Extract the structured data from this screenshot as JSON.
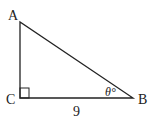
{
  "diagram": {
    "type": "right-triangle",
    "vertices": {
      "A": {
        "label": "A"
      },
      "B": {
        "label": "B"
      },
      "C": {
        "label": "C"
      }
    },
    "side_CB_length": "9",
    "angle_B_label": "θ°",
    "right_angle_at": "C",
    "stroke_color": "#222222"
  }
}
